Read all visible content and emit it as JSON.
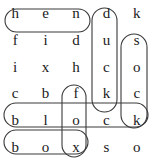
{
  "puzzle": {
    "type": "word-search",
    "rows": 6,
    "cols": 5,
    "grid": [
      [
        "h",
        "e",
        "n",
        "d",
        "k"
      ],
      [
        "f",
        "i",
        "d",
        "u",
        "s"
      ],
      [
        "i",
        "x",
        "h",
        "c",
        "o"
      ],
      [
        "c",
        "b",
        "f",
        "k",
        "c"
      ],
      [
        "b",
        "l",
        "o",
        "c",
        "k"
      ],
      [
        "b",
        "o",
        "x",
        "s",
        "o"
      ]
    ],
    "found_words": [
      {
        "word": "hen",
        "direction": "horizontal",
        "start_row": 1,
        "start_col": 1,
        "end_row": 1,
        "end_col": 3
      },
      {
        "word": "duck",
        "direction": "vertical",
        "start_row": 1,
        "start_col": 4,
        "end_row": 4,
        "end_col": 4
      },
      {
        "word": "sock",
        "direction": "vertical",
        "start_row": 2,
        "start_col": 5,
        "end_row": 5,
        "end_col": 5
      },
      {
        "word": "fox",
        "direction": "vertical",
        "start_row": 4,
        "start_col": 3,
        "end_row": 6,
        "end_col": 3
      },
      {
        "word": "block",
        "direction": "horizontal",
        "start_row": 5,
        "start_col": 1,
        "end_row": 5,
        "end_col": 5
      },
      {
        "word": "box",
        "direction": "horizontal",
        "start_row": 6,
        "start_col": 1,
        "end_row": 6,
        "end_col": 3
      }
    ],
    "colors": {
      "letter": "#1a1a1a",
      "highlight_stroke": "#3a3a3a",
      "background": "#ffffff"
    },
    "highlight_shapes": [
      {
        "name": "hen",
        "x": 5,
        "y": 9,
        "w": 85,
        "h": 23,
        "r": 11.5
      },
      {
        "name": "duck",
        "x": 92,
        "y": 8,
        "w": 25,
        "h": 104,
        "r": 12.5
      },
      {
        "name": "sock",
        "x": 121,
        "y": 34,
        "w": 26,
        "h": 94,
        "r": 13
      },
      {
        "name": "fox",
        "x": 62,
        "y": 85,
        "w": 24,
        "h": 72,
        "r": 12
      },
      {
        "name": "block",
        "x": 4,
        "y": 103,
        "w": 144,
        "h": 24,
        "r": 12
      },
      {
        "name": "box",
        "x": 4,
        "y": 130,
        "w": 84,
        "h": 24,
        "r": 12
      }
    ]
  }
}
